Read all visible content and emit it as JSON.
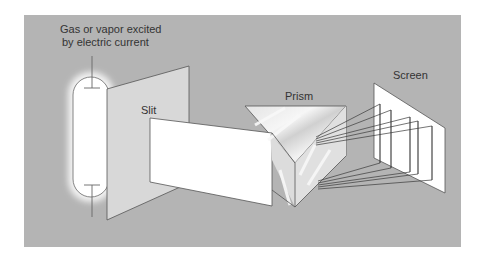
{
  "figure": {
    "labels": {
      "source_line1": "Gas or vapor excited",
      "source_line2": "by electric current",
      "slit": "Slit",
      "prism": "Prism",
      "screen": "Screen"
    },
    "colors": {
      "panel_background": "#b4b4b4",
      "page_background": "#ffffff",
      "tube_fill": "#ffffff",
      "slit_plate_fill": "#d8d8d8",
      "beam_fill": "#ffffff",
      "prism_fill": "#d6d6d6",
      "screen_fill": "#ffffff",
      "outline": "#555555",
      "spectral_lines": "#333333"
    },
    "components": [
      "gas discharge tube",
      "slit",
      "prism",
      "screen"
    ],
    "spectral_line_count": 5
  }
}
